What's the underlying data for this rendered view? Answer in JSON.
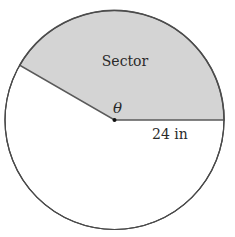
{
  "diagram": {
    "type": "circle-sector",
    "circle": {
      "center_x": 114.5,
      "center_y": 120,
      "radius": 109.5
    },
    "sector": {
      "label": "Sector",
      "start_angle_deg": 0,
      "end_angle_deg": 150
    },
    "angle_label": "θ",
    "radius_label": "24 in",
    "colors": {
      "sector_fill": "#d4d4d4",
      "sector_stroke": "#5a5a5a",
      "circle_stroke": "#3a3a3a",
      "center_dot": "#111111",
      "text": "#2a2a2a",
      "background": "#ffffff"
    }
  }
}
